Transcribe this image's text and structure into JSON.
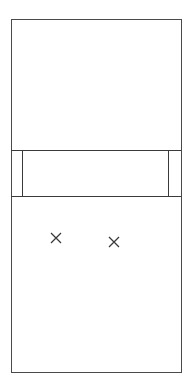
{
  "diagram": {
    "type": "outline-sketch",
    "outer_box": {
      "x": 11,
      "y": 19,
      "width": 170,
      "height": 353
    },
    "band": {
      "top": 150,
      "bottom": 196,
      "inner_left_x": 22,
      "inner_right_x": 168
    },
    "marks": [
      {
        "shape": "x",
        "cx": 56,
        "cy": 238
      },
      {
        "shape": "x",
        "cx": 114,
        "cy": 242
      }
    ],
    "stroke_color": "#3a3a3a",
    "background": "#ffffff"
  }
}
